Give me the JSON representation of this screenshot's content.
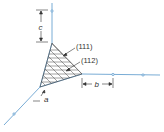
{
  "diagram": {
    "type": "crystal-plane-miller-indices",
    "planes": [
      {
        "label": "(111)"
      },
      {
        "label": "(112)"
      }
    ],
    "dimensions": {
      "a": "a",
      "b": "b",
      "c": "c"
    },
    "colors": {
      "axis": "#6aa3d0",
      "hatch": "#444444",
      "text": "#333333"
    }
  }
}
